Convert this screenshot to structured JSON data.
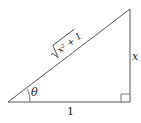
{
  "diagram": {
    "type": "right-triangle",
    "vertices": {
      "bottom_left": [
        8,
        102
      ],
      "bottom_right": [
        130,
        102
      ],
      "top_right": [
        130,
        9
      ]
    },
    "labels": {
      "hypotenuse": "√(x² + 1)",
      "hyp_radicand": "x² + 1",
      "opposite": "x",
      "adjacent": "1",
      "angle": "θ"
    },
    "stroke_color": "#555555",
    "text_color": "#222222"
  }
}
